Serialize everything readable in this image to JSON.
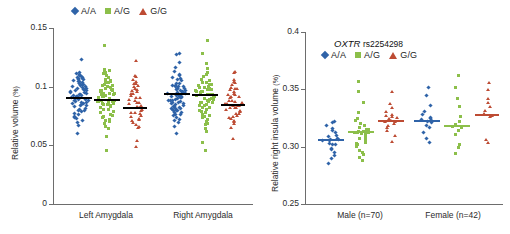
{
  "colors": {
    "AA": "#2f63a8",
    "AG": "#8cbf4a",
    "GG": "#bd4b33",
    "mean_left": "#000000",
    "axis": "#6d6d6d",
    "text": "#2b2b2b",
    "background": "#ffffff"
  },
  "legend": {
    "items": [
      {
        "label": "A/A",
        "marker": "diamond-marker-icon",
        "color": "#2f63a8"
      },
      {
        "label": "A/G",
        "marker": "square-marker-icon",
        "color": "#8cbf4a"
      },
      {
        "label": "G/G",
        "marker": "triangle-marker-icon",
        "color": "#bd4b33"
      }
    ]
  },
  "left_panel": {
    "ylabel": "Relative volume",
    "ylabel_unit": "(%)",
    "ticks": [
      "0.15",
      "0.1",
      "0.05",
      "0"
    ],
    "categories": [
      "Left Amygdala",
      "Right Amygdala"
    ]
  },
  "right_panel": {
    "title_gene": "OXTR",
    "title_rs": "rs2254298",
    "ylabel": "Relative right insula  volume",
    "ylabel_unit": "(%)",
    "ticks": [
      "0.4",
      "0.35",
      "0.30",
      "0.25"
    ],
    "categories": [
      "Male (n=70)",
      "Female (n=42)"
    ]
  },
  "chart_data": [
    {
      "type": "scatter",
      "title": "Relative amygdala volume by OXTR rs2254298 genotype",
      "xlabel": "",
      "ylabel": "Relative volume (%)",
      "ylim": [
        0,
        0.15
      ],
      "yticks": [
        0,
        0.05,
        0.1,
        0.15
      ],
      "grid": false,
      "legend_position": "top-center",
      "categories": [
        "Left Amygdala",
        "Right Amygdala"
      ],
      "mean_line_color": "#000000",
      "groups": [
        {
          "name": "A/A",
          "category": "Left Amygdala",
          "color": "#2f63a8",
          "marker": "diamond",
          "mean": 0.0905,
          "n": 70,
          "values": [
            0.1235,
            0.1125,
            0.1115,
            0.1105,
            0.1095,
            0.1085,
            0.108,
            0.1075,
            0.107,
            0.1065,
            0.106,
            0.1055,
            0.105,
            0.1045,
            0.104,
            0.1035,
            0.103,
            0.1025,
            0.102,
            0.1015,
            0.101,
            0.1005,
            0.1,
            0.0995,
            0.099,
            0.0985,
            0.098,
            0.0975,
            0.097,
            0.0965,
            0.096,
            0.0955,
            0.095,
            0.0945,
            0.094,
            0.0935,
            0.093,
            0.0925,
            0.092,
            0.0915,
            0.091,
            0.0905,
            0.09,
            0.0895,
            0.089,
            0.0885,
            0.088,
            0.0875,
            0.087,
            0.0865,
            0.086,
            0.0855,
            0.085,
            0.0845,
            0.084,
            0.083,
            0.082,
            0.081,
            0.08,
            0.079,
            0.078,
            0.077,
            0.076,
            0.075,
            0.074,
            0.0725,
            0.071,
            0.069,
            0.0665,
            0.06
          ]
        },
        {
          "name": "A/G",
          "category": "Left Amygdala",
          "color": "#8cbf4a",
          "marker": "square",
          "mean": 0.0885,
          "n": 66,
          "values": [
            0.1345,
            0.115,
            0.114,
            0.113,
            0.112,
            0.1105,
            0.109,
            0.108,
            0.107,
            0.106,
            0.105,
            0.104,
            0.103,
            0.102,
            0.101,
            0.1,
            0.0995,
            0.099,
            0.0985,
            0.098,
            0.0975,
            0.097,
            0.0965,
            0.096,
            0.0955,
            0.095,
            0.0945,
            0.094,
            0.0935,
            0.093,
            0.0925,
            0.092,
            0.0915,
            0.091,
            0.0905,
            0.09,
            0.0895,
            0.089,
            0.0885,
            0.088,
            0.0875,
            0.087,
            0.0865,
            0.086,
            0.0855,
            0.085,
            0.0845,
            0.084,
            0.083,
            0.082,
            0.081,
            0.08,
            0.079,
            0.078,
            0.077,
            0.076,
            0.075,
            0.074,
            0.0725,
            0.071,
            0.07,
            0.068,
            0.066,
            0.064,
            0.058,
            0.046
          ]
        },
        {
          "name": "G/G",
          "category": "Left Amygdala",
          "color": "#bd4b33",
          "marker": "triangle",
          "mean": 0.082,
          "n": 43,
          "values": [
            0.1225,
            0.1105,
            0.1085,
            0.1065,
            0.105,
            0.1035,
            0.102,
            0.1005,
            0.0995,
            0.0985,
            0.0975,
            0.0965,
            0.0955,
            0.0945,
            0.0935,
            0.0925,
            0.0915,
            0.0905,
            0.0895,
            0.0885,
            0.0875,
            0.0865,
            0.0855,
            0.0845,
            0.0835,
            0.0825,
            0.0815,
            0.0805,
            0.0795,
            0.0785,
            0.0775,
            0.0765,
            0.0755,
            0.0745,
            0.0735,
            0.0725,
            0.0715,
            0.07,
            0.0685,
            0.067,
            0.065,
            0.0545,
            0.0485
          ]
        },
        {
          "name": "A/A",
          "category": "Right Amygdala",
          "color": "#2f63a8",
          "marker": "diamond",
          "mean": 0.0935,
          "n": 70,
          "values": [
            0.1275,
            0.1265,
            0.12,
            0.1165,
            0.113,
            0.111,
            0.109,
            0.1075,
            0.1065,
            0.1055,
            0.1045,
            0.1035,
            0.1025,
            0.1015,
            0.101,
            0.1005,
            0.1,
            0.0995,
            0.099,
            0.0985,
            0.098,
            0.0975,
            0.097,
            0.0965,
            0.096,
            0.0955,
            0.095,
            0.0945,
            0.094,
            0.0935,
            0.093,
            0.0925,
            0.092,
            0.0915,
            0.091,
            0.0905,
            0.09,
            0.0895,
            0.089,
            0.0885,
            0.088,
            0.0875,
            0.087,
            0.0865,
            0.086,
            0.0855,
            0.085,
            0.0845,
            0.084,
            0.0835,
            0.083,
            0.0825,
            0.082,
            0.0815,
            0.081,
            0.0805,
            0.08,
            0.0795,
            0.079,
            0.0785,
            0.078,
            0.077,
            0.076,
            0.075,
            0.074,
            0.073,
            0.0715,
            0.07,
            0.0665,
            0.06
          ]
        },
        {
          "name": "A/G",
          "category": "Right Amygdala",
          "color": "#8cbf4a",
          "marker": "square",
          "mean": 0.0925,
          "n": 66,
          "values": [
            0.1395,
            0.129,
            0.1205,
            0.1155,
            0.112,
            0.11,
            0.1085,
            0.107,
            0.106,
            0.105,
            0.104,
            0.103,
            0.102,
            0.1015,
            0.101,
            0.1005,
            0.1,
            0.0995,
            0.099,
            0.0985,
            0.098,
            0.0975,
            0.097,
            0.0965,
            0.096,
            0.0955,
            0.095,
            0.0945,
            0.094,
            0.0935,
            0.093,
            0.0925,
            0.092,
            0.0915,
            0.091,
            0.0905,
            0.09,
            0.0895,
            0.089,
            0.0885,
            0.088,
            0.0875,
            0.087,
            0.0865,
            0.086,
            0.0855,
            0.0845,
            0.0835,
            0.0825,
            0.0815,
            0.0805,
            0.0795,
            0.0785,
            0.0775,
            0.0765,
            0.0755,
            0.0745,
            0.073,
            0.0715,
            0.07,
            0.0685,
            0.067,
            0.065,
            0.062,
            0.052,
            0.046
          ]
        },
        {
          "name": "G/G",
          "category": "Right Amygdala",
          "color": "#bd4b33",
          "marker": "triangle",
          "mean": 0.0845,
          "n": 43,
          "values": [
            0.113,
            0.1115,
            0.1065,
            0.1045,
            0.103,
            0.1015,
            0.1,
            0.099,
            0.098,
            0.097,
            0.096,
            0.095,
            0.094,
            0.093,
            0.092,
            0.091,
            0.09,
            0.089,
            0.088,
            0.087,
            0.086,
            0.0855,
            0.085,
            0.0845,
            0.084,
            0.0835,
            0.083,
            0.0825,
            0.082,
            0.081,
            0.08,
            0.079,
            0.078,
            0.077,
            0.076,
            0.075,
            0.074,
            0.073,
            0.0715,
            0.07,
            0.068,
            0.065,
            0.0555
          ]
        }
      ]
    },
    {
      "type": "scatter",
      "title": "OXTR rs2254298",
      "xlabel": "",
      "ylabel": "Relative right insula volume (%)",
      "ylim": [
        0.25,
        0.4
      ],
      "yticks": [
        0.25,
        0.3,
        0.35,
        0.4
      ],
      "grid": false,
      "legend_position": "top-center",
      "categories": [
        "Male (n=70)",
        "Female (n=42)"
      ],
      "mean_line_color": "group",
      "groups": [
        {
          "name": "A/A",
          "category": "Male (n=70)",
          "color": "#2f63a8",
          "marker": "diamond",
          "mean": 0.3055,
          "n": 22,
          "values": [
            0.3225,
            0.3215,
            0.319,
            0.3165,
            0.314,
            0.312,
            0.31,
            0.3085,
            0.307,
            0.306,
            0.3055,
            0.305,
            0.3045,
            0.3035,
            0.3025,
            0.301,
            0.2995,
            0.2975,
            0.295,
            0.2925,
            0.2895,
            0.2855
          ]
        },
        {
          "name": "A/G",
          "category": "Male (n=70)",
          "color": "#8cbf4a",
          "marker": "square",
          "mean": 0.3125,
          "n": 30,
          "values": [
            0.356,
            0.3485,
            0.339,
            0.33,
            0.3245,
            0.3225,
            0.3205,
            0.319,
            0.3175,
            0.316,
            0.315,
            0.314,
            0.313,
            0.3125,
            0.312,
            0.3115,
            0.311,
            0.31,
            0.3085,
            0.307,
            0.3055,
            0.304,
            0.3025,
            0.301,
            0.2995,
            0.2975,
            0.2955,
            0.293,
            0.2905,
            0.2875
          ]
        },
        {
          "name": "G/G",
          "category": "Male (n=70)",
          "color": "#bd4b33",
          "marker": "triangle",
          "mean": 0.3225,
          "n": 18,
          "values": [
            0.349,
            0.3385,
            0.334,
            0.331,
            0.329,
            0.3275,
            0.326,
            0.325,
            0.324,
            0.323,
            0.3225,
            0.3215,
            0.32,
            0.3185,
            0.3165,
            0.3145,
            0.3105,
            0.3045
          ]
        },
        {
          "name": "A/A",
          "category": "Female (n=42)",
          "color": "#2f63a8",
          "marker": "diamond",
          "mean": 0.3225,
          "n": 16,
          "values": [
            0.3505,
            0.3445,
            0.3355,
            0.3305,
            0.328,
            0.326,
            0.3245,
            0.3235,
            0.3225,
            0.3215,
            0.3205,
            0.319,
            0.3165,
            0.313,
            0.3075,
            0.3035
          ]
        },
        {
          "name": "A/G",
          "category": "Female (n=42)",
          "color": "#8cbf4a",
          "marker": "square",
          "mean": 0.318,
          "n": 15,
          "values": [
            0.3625,
            0.352,
            0.343,
            0.335,
            0.326,
            0.3215,
            0.3195,
            0.3185,
            0.3175,
            0.3165,
            0.315,
            0.31,
            0.3015,
            0.2985,
            0.2935
          ]
        },
        {
          "name": "G/G",
          "category": "Female (n=42)",
          "color": "#bd4b33",
          "marker": "triangle",
          "mean": 0.328,
          "n": 11,
          "values": [
            0.3555,
            0.349,
            0.343,
            0.339,
            0.335,
            0.331,
            0.329,
            0.3275,
            0.3255,
            0.306,
            0.304
          ]
        }
      ]
    }
  ]
}
